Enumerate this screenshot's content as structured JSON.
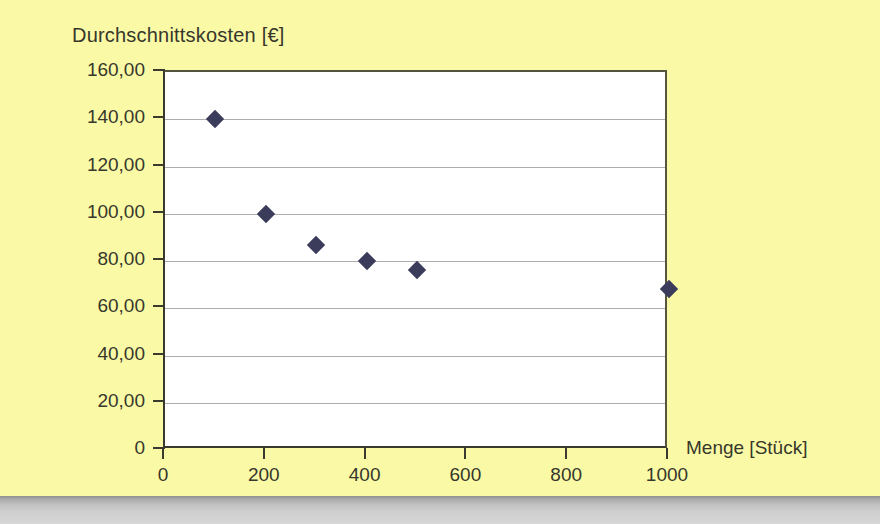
{
  "page": {
    "background_color": "#fafaa6",
    "plot_background_color": "#ffffff",
    "marker_color": "#3b3b5c",
    "gridline_color": "#adadad",
    "axis_color": "#3a3a30",
    "text_color": "#37372c"
  },
  "chart_data": {
    "type": "scatter",
    "title": "Durchschnittskosten [€]",
    "xlabel": "Menge [Stück]",
    "ylabel": "Durchschnittskosten [€]",
    "x": [
      100,
      200,
      300,
      400,
      500,
      1000
    ],
    "values": [
      140.0,
      100.0,
      86.67,
      80.0,
      76.0,
      68.0
    ],
    "xlim": [
      0,
      1000
    ],
    "ylim": [
      0,
      160
    ],
    "xticks": [
      0,
      200,
      400,
      600,
      800,
      1000
    ],
    "xtick_labels": [
      "0",
      "200",
      "400",
      "600",
      "800",
      "1000"
    ],
    "yticks": [
      0,
      20,
      40,
      60,
      80,
      100,
      120,
      140,
      160
    ],
    "ytick_labels": [
      "0",
      "20,00",
      "40,00",
      "60,00",
      "80,00",
      "100,00",
      "120,00",
      "140,00",
      "160,00"
    ],
    "grid": "horizontal",
    "legend": null,
    "series": [
      {
        "name": "Durchschnittskosten",
        "marker": "diamond",
        "points": [
          {
            "x": 100,
            "y": 140.0
          },
          {
            "x": 200,
            "y": 100.0
          },
          {
            "x": 300,
            "y": 86.67
          },
          {
            "x": 400,
            "y": 80.0
          },
          {
            "x": 500,
            "y": 76.0
          },
          {
            "x": 1000,
            "y": 68.0
          }
        ]
      }
    ]
  }
}
